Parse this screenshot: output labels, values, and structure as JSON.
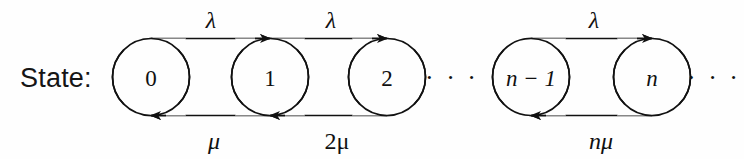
{
  "diagram": {
    "title_label": "State:",
    "type": "birth-death-markov-chain-state-transition-diagram",
    "stroke_color": "#111111",
    "background_color": "#fefefe",
    "nodes": [
      {
        "id": "n0",
        "label": "0",
        "cx": 151,
        "cy": 77,
        "r": 38.5,
        "italic": false
      },
      {
        "id": "n1",
        "label": "1",
        "cx": 270,
        "cy": 77,
        "r": 38.5,
        "italic": false
      },
      {
        "id": "n2",
        "label": "2",
        "cx": 387,
        "cy": 77,
        "r": 38.5,
        "italic": false
      },
      {
        "id": "nm1",
        "label": "n − 1",
        "cx": 531,
        "cy": 77,
        "r": 38.5,
        "italic": true
      },
      {
        "id": "nn",
        "label": "n",
        "cx": 652,
        "cy": 77,
        "r": 38.5,
        "italic": true
      }
    ],
    "forward_rates": [
      {
        "from": "n0",
        "to": "n1",
        "label": "λ",
        "x": 211,
        "y": 28
      },
      {
        "from": "n1",
        "to": "n2",
        "label": "λ",
        "x": 331,
        "y": 28
      },
      {
        "from": "nm1",
        "to": "nn",
        "label": "λ",
        "x": 594,
        "y": 28
      }
    ],
    "backward_rates": [
      {
        "from": "n1",
        "to": "n0",
        "label": "μ",
        "x": 214,
        "y": 145
      },
      {
        "from": "n2",
        "to": "n1",
        "label": "2μ",
        "x": 336,
        "y": 145
      },
      {
        "from": "nn",
        "to": "nm1",
        "label": "nμ",
        "x": 600,
        "y": 145
      }
    ],
    "ellipses": [
      {
        "id": "middle-ellipsis",
        "label": "· · ·",
        "x": 452,
        "y": 86
      },
      {
        "id": "trailing-ellipsis",
        "label": "· · ·",
        "x": 713,
        "y": 86
      }
    ],
    "state_label": {
      "x": 20,
      "y": 87
    },
    "geometry": {
      "top_edge_y": 39,
      "bottom_edge_y": 115,
      "circle_radius": 38.5,
      "circle_center_y": 77
    }
  }
}
